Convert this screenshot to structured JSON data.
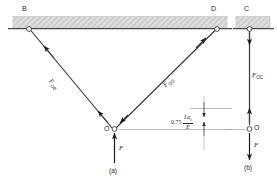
{
  "figure": {
    "title_a": "(a)",
    "title_b": "(b)",
    "nodes": {
      "B": "B",
      "D": "D",
      "C": "C",
      "O_left": "O",
      "O_right": "O"
    },
    "forces": {
      "F_OB": {
        "symbol": "F",
        "sub": "OB"
      },
      "F_OD": {
        "symbol": "F",
        "sub": "OD"
      },
      "F_OC": {
        "symbol": "F",
        "sub": "OC"
      },
      "F_applied_a": "F",
      "F_applied_b": "F"
    },
    "dimension": {
      "coefficient": "0.75",
      "numerator": "Lα",
      "numerator_sub": "t",
      "denominator": "E"
    },
    "colors": {
      "ink": "#2b2b2b",
      "hatch_fill": "#d8d8d8",
      "hatch_line": "#b4b4b4",
      "member": "#3a3a3a",
      "thin_rule": "#9a9a9a",
      "background": "#ffffff"
    }
  }
}
